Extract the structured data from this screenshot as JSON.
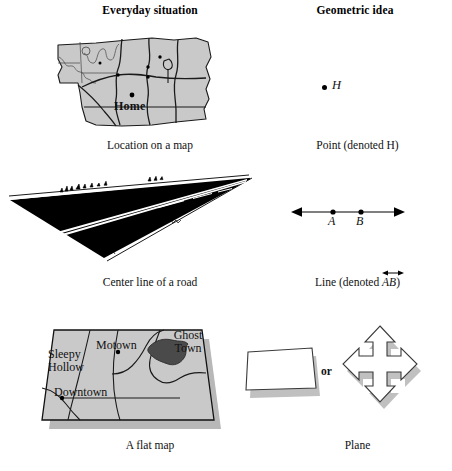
{
  "figure": {
    "type": "textbook-comparison-figure",
    "columns": [
      {
        "id": "everyday",
        "header": "Everyday situation"
      },
      {
        "id": "geometric",
        "header": "Geometric idea"
      }
    ],
    "rows": [
      {
        "id": "point",
        "everyday": {
          "caption": "Location on a map",
          "art": "state-map-with-home-marker",
          "marker_label": "Home"
        },
        "geometric": {
          "caption": "Point (denoted H)",
          "art": "single-dot",
          "point_label": "H"
        }
      },
      {
        "id": "line",
        "everyday": {
          "caption": "Center line of a road",
          "art": "perspective-road"
        },
        "geometric": {
          "caption_prefix": "Line  (denoted ",
          "caption_denoted": "AB",
          "caption_suffix": ")",
          "art": "double-headed-arrow-line",
          "point_labels": [
            "A",
            "B"
          ]
        }
      },
      {
        "id": "plane",
        "everyday": {
          "caption": "A flat map",
          "art": "tilted-flat-map",
          "place_labels": [
            "Sleepy Hollow",
            "Motown",
            "Ghost Town",
            "Downtown"
          ]
        },
        "geometric": {
          "caption": "Plane",
          "art": "parallelogram-and-four-way-arrow",
          "connector": "or"
        }
      }
    ]
  },
  "labels": {
    "header_left": "Everyday situation",
    "header_right": "Geometric idea",
    "cap_map": "Location on a map",
    "cap_point": "Point (denoted H)",
    "cap_road": "Center line of a road",
    "cap_line_prefix": "Line  (denoted ",
    "cap_line_denoted": "AB",
    "cap_line_suffix": ")",
    "cap_flatmap": "A flat map",
    "cap_plane": "Plane",
    "home": "Home",
    "point_h": "H",
    "point_a": "A",
    "point_b": "B",
    "sleepy": "Sleepy",
    "hollow": "Hollow",
    "motown": "Motown",
    "ghost": "Ghost",
    "town": "Town",
    "downtown": "Downtown",
    "or": "or"
  },
  "colors": {
    "ink": "#000000",
    "paper": "#ffffff",
    "map_fill": "#c9c9c9",
    "map_fill_dark": "#4a4a4a",
    "road_black": "#000000",
    "shadow": "#b4b4b4",
    "outline": "#1a1a1a"
  }
}
